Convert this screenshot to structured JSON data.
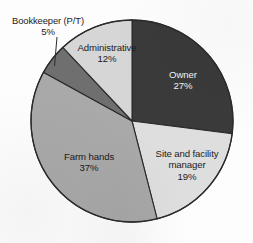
{
  "chart_data": {
    "type": "pie",
    "title": "",
    "subtitle": "",
    "xlabel": "",
    "ylabel": "",
    "legend_position": "none",
    "labels_inline": true,
    "start_angle_deg": 0,
    "direction": "clockwise",
    "categories": [
      "Owner",
      "Site and facility manager",
      "Farm hands",
      "Bookkeeper (P/T)",
      "Administrative"
    ],
    "values": [
      27,
      19,
      37,
      5,
      12
    ],
    "units": "percent",
    "slices": [
      {
        "label": "Owner",
        "label_line1": "Owner",
        "value": 27,
        "pct_text": "27%",
        "color": "#3a3a3a",
        "text_color": "#f2f2f2",
        "label_placement": "inside"
      },
      {
        "label": "Site and facility manager",
        "label_line1": "Site and facility",
        "label_line2": "manager",
        "value": 19,
        "pct_text": "19%",
        "color": "#dedede",
        "text_color": "#1b1b1b",
        "label_placement": "inside"
      },
      {
        "label": "Farm hands",
        "label_line1": "Farm hands",
        "value": 37,
        "pct_text": "37%",
        "color": "#a9a9a9",
        "text_color": "#1b1b1b",
        "label_placement": "inside"
      },
      {
        "label": "Bookkeeper (P/T)",
        "label_line1": "Bookkeeper (P/T)",
        "value": 5,
        "pct_text": "5%",
        "color": "#6f6f6f",
        "text_color": "#1b1b1b",
        "label_placement": "outside-with-leader"
      },
      {
        "label": "Administrative",
        "label_line1": "Administrative",
        "value": 12,
        "pct_text": "12%",
        "color": "#d6d6d6",
        "text_color": "#1b1b1b",
        "label_placement": "inside"
      }
    ]
  },
  "colors": {
    "background": "#fdfdfd",
    "outline": "#2b2b2b",
    "owner": "#3a3a3a",
    "site_manager": "#dedede",
    "farm_hands": "#a9a9a9",
    "bookkeeper": "#6f6f6f",
    "administrative": "#d6d6d6",
    "label_dark": "#1b1b1b",
    "label_light": "#f2f2f2"
  }
}
